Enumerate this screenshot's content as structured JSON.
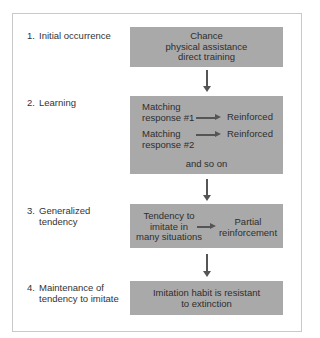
{
  "diagram": {
    "steps": [
      {
        "number": "1.",
        "label_lines": [
          "Initial occurrence"
        ],
        "box": {
          "lines": [
            "Chance",
            "physical assistance",
            "direct training"
          ]
        }
      },
      {
        "number": "2.",
        "label_lines": [
          "Learning"
        ],
        "box": {
          "rows": [
            {
              "left_lines": [
                "Matching",
                "response #1"
              ],
              "right": "Reinforced"
            },
            {
              "left_lines": [
                "Matching",
                "response #2"
              ],
              "right": "Reinforced"
            }
          ],
          "footer": "and so on"
        }
      },
      {
        "number": "3.",
        "label_lines": [
          "Generalized",
          "tendency"
        ],
        "box": {
          "left_lines": [
            "Tendency to",
            "imitate in",
            "many situations"
          ],
          "right_lines": [
            "Partial",
            "reinforcement"
          ]
        }
      },
      {
        "number": "4.",
        "label_lines": [
          "Maintenance of",
          "tendency to imitate"
        ],
        "box": {
          "lines": [
            "Imitation habit is resistant",
            "to extinction"
          ]
        }
      }
    ],
    "colors": {
      "box_fill": "#a9a9a9",
      "arrow": "#555555",
      "frame_border": "#c9c9c9"
    }
  }
}
